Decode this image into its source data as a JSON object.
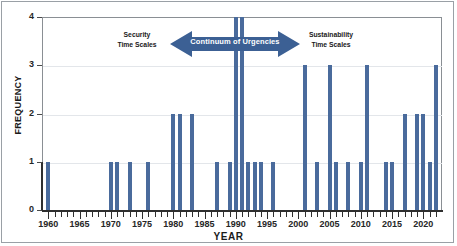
{
  "chart_data": {
    "type": "bar",
    "title": "",
    "xlabel": "YEAR",
    "ylabel": "FREQUENCY",
    "xlim": [
      1959,
      2023
    ],
    "ylim": [
      0,
      4
    ],
    "ytick_labels": [
      "0",
      "1",
      "2",
      "3",
      "4"
    ],
    "ytick_values": [
      0,
      1,
      2,
      3,
      4
    ],
    "xtick_labels": [
      "1960",
      "1965",
      "1970",
      "1975",
      "1980",
      "1985",
      "1990",
      "1995",
      "2000",
      "2005",
      "2010",
      "2015",
      "2020"
    ],
    "xtick_values": [
      1960,
      1965,
      1970,
      1975,
      1980,
      1985,
      1990,
      1995,
      2000,
      2005,
      2010,
      2015,
      2020
    ],
    "minor_ticks": "every year",
    "grid": "horizontal gridlines only",
    "legend": "none",
    "bar_color": "#4a6b9c",
    "categories": [
      1960,
      1961,
      1962,
      1963,
      1964,
      1965,
      1966,
      1967,
      1968,
      1969,
      1970,
      1971,
      1972,
      1973,
      1974,
      1975,
      1976,
      1977,
      1978,
      1979,
      1980,
      1981,
      1982,
      1983,
      1984,
      1985,
      1986,
      1987,
      1988,
      1989,
      1990,
      1991,
      1992,
      1993,
      1994,
      1995,
      1996,
      1997,
      1998,
      1999,
      2000,
      2001,
      2002,
      2003,
      2004,
      2005,
      2006,
      2007,
      2008,
      2009,
      2010,
      2011,
      2012,
      2013,
      2014,
      2015,
      2016,
      2017,
      2018,
      2019,
      2020,
      2021,
      2022
    ],
    "values": [
      1,
      0,
      0,
      0,
      0,
      0,
      0,
      0,
      0,
      0,
      1,
      1,
      0,
      1,
      0,
      0,
      1,
      0,
      0,
      0,
      2,
      2,
      0,
      2,
      0,
      0,
      0,
      1,
      0,
      1,
      4,
      4,
      1,
      1,
      1,
      0,
      1,
      0,
      0,
      0,
      0,
      3,
      0,
      1,
      0,
      3,
      1,
      0,
      1,
      0,
      1,
      3,
      0,
      0,
      1,
      1,
      0,
      2,
      0,
      2,
      2,
      1,
      3
    ],
    "annotations": {
      "left_label": "Security\nTime Scales",
      "left_label_line1": "Security",
      "left_label_line2": "Time Scales",
      "center_label": "Continuum of Urgencies",
      "right_label_line1": "Sustainability",
      "right_label_line2": "Time Scales",
      "arrow_color": "#3c6094",
      "arrow_text_color": "#ffffff",
      "arrow_direction": "double"
    }
  }
}
